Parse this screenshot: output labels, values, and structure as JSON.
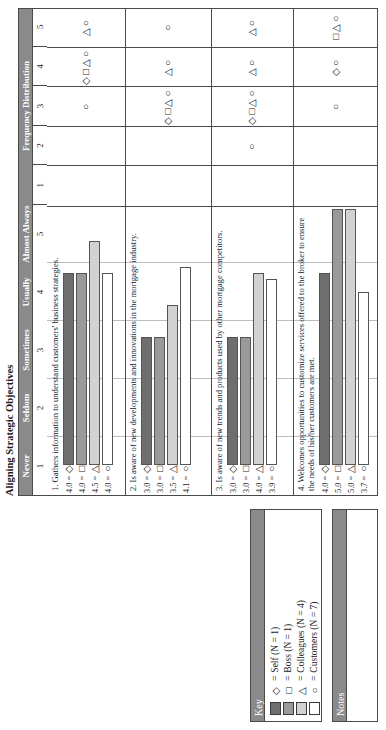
{
  "page": {
    "title": "Aligning Strategic Objectives"
  },
  "key": {
    "title": "Key",
    "items": [
      {
        "shape": "◇",
        "swatch": "#6e6e6e",
        "eq": "=",
        "label": "Self (N = 1)"
      },
      {
        "shape": "□",
        "swatch": "#9a9a9a",
        "eq": "=",
        "label": "Boss (N = 1)"
      },
      {
        "shape": "△",
        "swatch": "#d2d2d2",
        "eq": "=",
        "label": "Colleagues (N = 4)"
      },
      {
        "shape": "○",
        "swatch": "#ffffff",
        "eq": "=",
        "label": "Customers (N = 7)"
      }
    ]
  },
  "notes": {
    "title": "Notes",
    "content": ""
  },
  "chart_data": {
    "type": "bar",
    "title": "Aligning Strategic Objectives",
    "xlabel": "",
    "ylabel": "",
    "xlim": [
      1,
      5
    ],
    "grid": true,
    "legend_position": "separate-key-panel",
    "scale_labels": [
      "Never",
      "Seldom",
      "Sometimes",
      "Usually",
      "Almost Always"
    ],
    "scale_numbers": [
      "1",
      "2",
      "3",
      "4",
      "5"
    ],
    "freq_header": "Frequency Distribution",
    "freq_numbers": [
      "1",
      "2",
      "3",
      "4",
      "5"
    ],
    "rater_series": [
      "Self",
      "Boss",
      "Colleagues",
      "Customers"
    ],
    "rater_shapes": [
      "◇",
      "□",
      "△",
      "○"
    ],
    "rater_colors": [
      "#6e6e6e",
      "#9a9a9a",
      "#d2d2d2",
      "#ffffff"
    ],
    "items": [
      {
        "number": "1.",
        "statement": "1. Gathers information to understand customers' business strategies.",
        "values": [
          4.0,
          4.0,
          4.5,
          4.0
        ],
        "labels": [
          "4.0",
          "4.0",
          "4.5",
          "4.0"
        ],
        "freq": {
          "1": [],
          "2": [],
          "3": [
            "○"
          ],
          "4": [
            "◇",
            "□",
            "△",
            "○"
          ],
          "5": [
            "△",
            "○"
          ]
        }
      },
      {
        "number": "2.",
        "statement": "2. Is aware of new developments and innovations in the mortgage industry.",
        "values": [
          3.0,
          3.0,
          3.5,
          4.1
        ],
        "labels": [
          "3.0",
          "3.0",
          "3.5",
          "4.1"
        ],
        "freq": {
          "1": [],
          "2": [],
          "3": [
            "◇",
            "□",
            "△",
            "○"
          ],
          "4": [
            "△",
            "○"
          ],
          "5": [
            "○"
          ]
        }
      },
      {
        "number": "3.",
        "statement": "3. Is aware of new trends and products used by other mortgage competitors.",
        "values": [
          3.0,
          3.0,
          4.0,
          3.9
        ],
        "labels": [
          "3.0",
          "3.0",
          "4.0",
          "3.9"
        ],
        "freq": {
          "1": [],
          "2": [
            "○"
          ],
          "3": [
            "◇",
            "□",
            "△",
            "○"
          ],
          "4": [
            "△",
            "○"
          ],
          "5": [
            "△",
            "○"
          ]
        }
      },
      {
        "number": "4.",
        "statement": "4. Welcomes opportunities to customize services offered to the broker to ensure the needs of his/her customers are met.",
        "values": [
          4.0,
          5.0,
          5.0,
          3.7
        ],
        "labels": [
          "4.0",
          "5.0",
          "5.0",
          "3.7"
        ],
        "freq": {
          "1": [],
          "2": [],
          "3": [
            "○"
          ],
          "4": [
            "◇",
            "○"
          ],
          "5": [
            "□",
            "△",
            "○"
          ]
        }
      }
    ]
  }
}
